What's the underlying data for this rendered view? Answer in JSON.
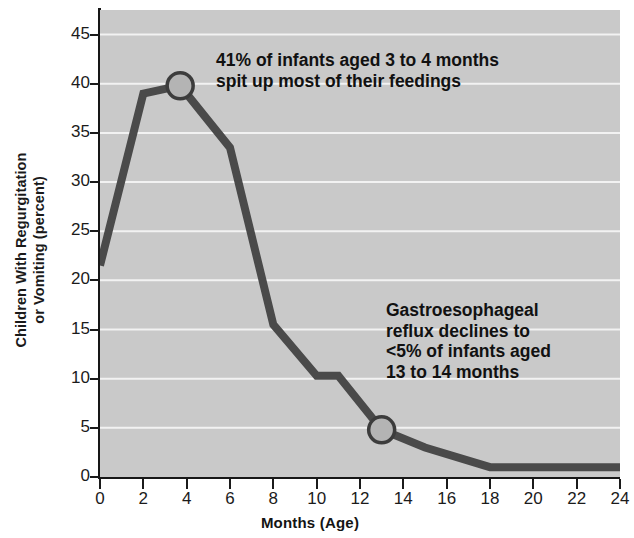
{
  "chart_data": {
    "type": "line",
    "title": "",
    "xlabel": "Months (Age)",
    "ylabel": "Children With Regurgitation or Vomiting (percent)",
    "ylabel_lines": [
      "Children With Regurgitation",
      "or Vomiting (percent)"
    ],
    "xlim": [
      0,
      24
    ],
    "ylim": [
      0,
      47.5
    ],
    "xticks": [
      0,
      2,
      4,
      6,
      8,
      10,
      12,
      14,
      16,
      18,
      20,
      22,
      24
    ],
    "xticklabels": [
      "0",
      "2",
      "4",
      "6",
      "8",
      "10",
      "12",
      "14",
      "16",
      "18",
      "20",
      "22",
      "24"
    ],
    "yticks": [
      0,
      5,
      10,
      15,
      20,
      25,
      30,
      35,
      40,
      45
    ],
    "yticklabels": [
      "0",
      "5",
      "10",
      "15",
      "20",
      "25",
      "30",
      "35",
      "40",
      "45"
    ],
    "grid": "horizontal",
    "legend": "none",
    "series": [
      {
        "name": "Children with regurgitation or vomiting",
        "x": [
          0,
          2,
          3.7,
          6,
          8,
          10,
          11,
          13,
          15,
          18,
          24
        ],
        "values": [
          21.5,
          39.0,
          39.8,
          33.5,
          15.5,
          10.3,
          10.3,
          4.8,
          3.0,
          1.0,
          1.0
        ],
        "color": "#4a4a4a",
        "line_width": 8
      }
    ],
    "markers": [
      {
        "x": 3.7,
        "y": 39.8,
        "shape": "circle",
        "fill": "#b4b4b4",
        "stroke": "#3c3c3c"
      },
      {
        "x": 13,
        "y": 4.8,
        "shape": "circle",
        "fill": "#b4b4b4",
        "stroke": "#3c3c3c"
      }
    ],
    "annotations": [
      {
        "id": "annotation-peak",
        "text": "41% of infants aged 3 to 4 months spit up most of their feedings",
        "lines": [
          "41% of infants aged 3 to 4 months",
          "spit up most of their feedings"
        ]
      },
      {
        "id": "annotation-decline",
        "text": "Gastroesophageal reflux declines to <5% of infants aged 13 to 14 months",
        "lines": [
          "Gastroesophageal",
          "reflux declines to",
          "<5% of infants aged",
          "13 to 14 months"
        ]
      }
    ],
    "colors": {
      "plot_background": "#c9c9c9",
      "gridline": "#f2f2f2",
      "axis": "#171717",
      "line": "#4a4a4a",
      "marker_fill": "#b4b4b4",
      "text": "#111111"
    }
  }
}
